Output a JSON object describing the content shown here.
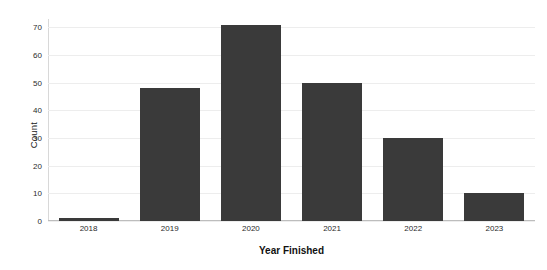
{
  "chart_data": {
    "type": "bar",
    "title": "",
    "subtitle": "",
    "xlabel": "Year Finished",
    "ylabel": "Count",
    "categories": [
      "2018",
      "2019",
      "2020",
      "2021",
      "2022",
      "2023"
    ],
    "values": [
      1,
      48,
      71,
      50,
      30,
      10
    ],
    "series": [
      {
        "name": "Count",
        "values": [
          1,
          48,
          71,
          50,
          30,
          10
        ]
      }
    ],
    "ylim": [
      0,
      73
    ],
    "xlim": null,
    "yticks": [
      0,
      10,
      20,
      30,
      40,
      50,
      60,
      70
    ],
    "ytick_labels": [
      "0",
      "10",
      "20",
      "30",
      "40",
      "50",
      "60",
      "70"
    ],
    "xtick_labels": [
      "2018",
      "2019",
      "2020",
      "2021",
      "2022",
      "2023"
    ],
    "grid": "horizontal",
    "legend": "none",
    "legend_position": "none",
    "annotations": [],
    "colors": {
      "bar": "#3a3a3a",
      "gridline": "#ededed",
      "baseline": "#bdbdbd",
      "axis_spine": "#d8d8d8",
      "background": "#ffffff",
      "tick_text": "#2b2b2b",
      "axis_title": "#111111"
    }
  }
}
